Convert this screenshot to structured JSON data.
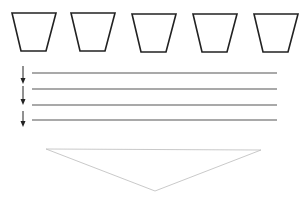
{
  "diagram": {
    "containers": [
      {
        "id": "container-1",
        "points": "12,13 56,13 46,51 21,51"
      },
      {
        "id": "container-2",
        "points": "71,13 115,13 105,51 80,51"
      },
      {
        "id": "container-3",
        "points": "132,14 176,14 166,52 141,52"
      },
      {
        "id": "container-4",
        "points": "193,14 237,14 227,52 202,52"
      },
      {
        "id": "container-5",
        "points": "254,14 298,14 288,52 263,52"
      }
    ],
    "lines": [
      {
        "y": 73,
        "x1": 32,
        "x2": 277
      },
      {
        "y": 89,
        "x1": 32,
        "x2": 277
      },
      {
        "y": 105,
        "x1": 32,
        "x2": 277
      },
      {
        "y": 120,
        "x1": 32,
        "x2": 277
      }
    ],
    "arrows": [
      {
        "x": 23,
        "y1": 66,
        "y2": 84
      },
      {
        "x": 23,
        "y1": 86,
        "y2": 105
      },
      {
        "x": 23,
        "y1": 111,
        "y2": 127
      }
    ],
    "funnel": {
      "points": "46,149 261,150 155,191"
    },
    "colors": {
      "stroke": "#222222",
      "line": "#555555",
      "funnel": "#bbbbbb"
    }
  }
}
